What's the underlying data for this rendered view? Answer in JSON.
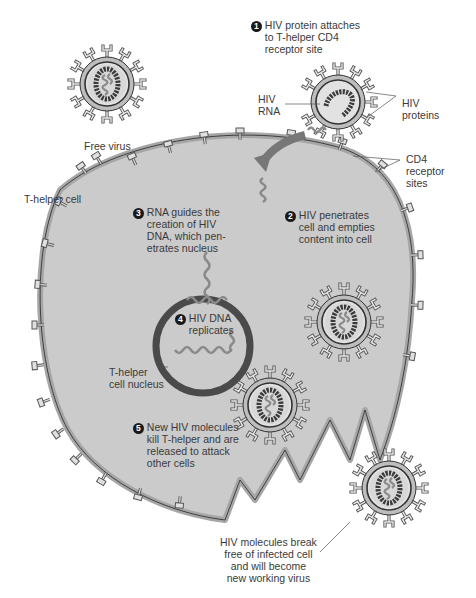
{
  "diagram": {
    "colors": {
      "cell_fill": "#c9c9c9",
      "membrane": "#a8a8a8",
      "outline": "#2a2a2a",
      "nucleus_ring": "#444444",
      "rna_strand": "#8a8a8a",
      "capsid_beads": "#3a3a3a",
      "arrow": "#777777",
      "text": "#3a3a3a"
    },
    "labels": {
      "free_virus": "Free virus",
      "t_helper_cell": "T-helper cell",
      "hiv_rna": "HIV\nRNA",
      "hiv_proteins": "HIV\nproteins",
      "cd4_sites": "CD4\nreceptor\nsites",
      "nucleus": "T-helper\ncell nucleus",
      "break_free": "HIV molecules break\nfree of infected cell\nand will become\nnew working virus"
    },
    "steps": [
      {
        "number": "1",
        "text": "HIV protein attaches\nto T-helper CD4\nreceptor site"
      },
      {
        "number": "2",
        "text": "HIV penetrates\ncell and empties\ncontent into cell"
      },
      {
        "number": "3",
        "text": "RNA guides the\ncreation of HIV\nDNA, which pen-\netrates nucleus"
      },
      {
        "number": "4",
        "text": "HIV DNA\nreplicates"
      },
      {
        "number": "5",
        "text": "New HIV molecules\nkill T-helper and are\nreleased to attack\nother cells"
      }
    ]
  }
}
